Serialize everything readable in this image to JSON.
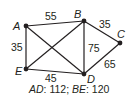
{
  "diagram": {
    "vertices": [
      {
        "id": "A",
        "label": "A"
      },
      {
        "id": "B",
        "label": "B"
      },
      {
        "id": "C",
        "label": "C"
      },
      {
        "id": "D",
        "label": "D"
      },
      {
        "id": "E",
        "label": "E"
      }
    ],
    "edges": [
      {
        "from": "A",
        "to": "B",
        "weight": "55"
      },
      {
        "from": "B",
        "to": "C",
        "weight": "35"
      },
      {
        "from": "A",
        "to": "E",
        "weight": "35"
      },
      {
        "from": "B",
        "to": "D",
        "weight": "75"
      },
      {
        "from": "C",
        "to": "D",
        "weight": "65"
      },
      {
        "from": "E",
        "to": "D",
        "weight": "45"
      },
      {
        "from": "A",
        "to": "D",
        "weight": ""
      },
      {
        "from": "B",
        "to": "E",
        "weight": ""
      }
    ],
    "note": {
      "ad_label": "AD",
      "ad_value": ": 112; ",
      "be_label": "BE",
      "be_value": ": 120"
    }
  }
}
